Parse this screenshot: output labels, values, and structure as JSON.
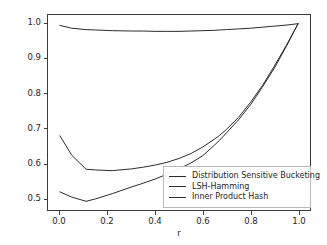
{
  "chart_data": {
    "type": "line",
    "title": "",
    "xlabel": "r",
    "ylabel": "Theoretical Query Complexity",
    "xlim": [
      -0.05,
      1.05
    ],
    "ylim": [
      0.465,
      1.025
    ],
    "grid": false,
    "legend_position": "lower right",
    "xticks": [
      "0.0",
      "0.2",
      "0.4",
      "0.6",
      "0.8",
      "1.0"
    ],
    "xtick_values": [
      0.0,
      0.2,
      0.4,
      0.6,
      0.8,
      1.0
    ],
    "yticks": [
      "0.5",
      "0.6",
      "0.7",
      "0.8",
      "0.9",
      "1.0"
    ],
    "ytick_values": [
      0.5,
      0.6,
      0.7,
      0.8,
      0.9,
      1.0
    ],
    "x": [
      0.0,
      0.05,
      0.11,
      0.15,
      0.22,
      0.3,
      0.35,
      0.4,
      0.45,
      0.5,
      0.55,
      0.6,
      0.65,
      0.67,
      0.7,
      0.75,
      0.8,
      0.85,
      0.9,
      0.95,
      1.0
    ],
    "series": [
      {
        "name": "Distribution Sensitive Bucketing",
        "color": "#2b2b2b",
        "values": [
          0.678,
          0.622,
          0.582,
          0.58,
          0.578,
          0.583,
          0.588,
          0.594,
          0.602,
          0.613,
          0.627,
          0.646,
          0.669,
          0.679,
          0.697,
          0.731,
          0.774,
          0.822,
          0.878,
          0.937,
          1.0
        ]
      },
      {
        "name": "LSH-Hamming",
        "color": "#2b2b2b",
        "values": [
          0.995,
          0.987,
          0.983,
          0.982,
          0.98,
          0.979,
          0.979,
          0.978,
          0.978,
          0.978,
          0.979,
          0.98,
          0.981,
          0.982,
          0.983,
          0.985,
          0.987,
          0.99,
          0.993,
          0.996,
          1.0
        ]
      },
      {
        "name": "Inner Product Hash",
        "color": "#2b2b2b",
        "values": [
          0.517,
          0.502,
          0.49,
          0.497,
          0.512,
          0.531,
          0.542,
          0.554,
          0.568,
          0.583,
          0.6,
          0.621,
          0.652,
          0.665,
          0.687,
          0.724,
          0.767,
          0.818,
          0.872,
          0.934,
          1.0
        ]
      }
    ]
  },
  "legend": {
    "entries": [
      {
        "label": "Distribution Sensitive Bucketing"
      },
      {
        "label": "LSH-Hamming"
      },
      {
        "label": "Inner Product Hash"
      }
    ]
  }
}
